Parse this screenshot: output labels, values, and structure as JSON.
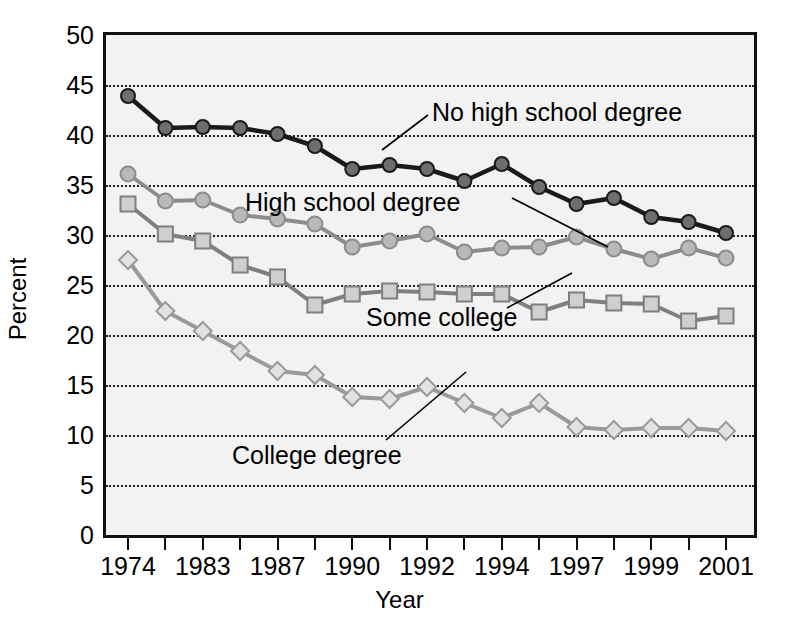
{
  "chart_data": {
    "type": "line",
    "title": "",
    "xlabel": "Year",
    "ylabel": "Percent",
    "ylim": [
      0,
      50
    ],
    "y_ticks": [
      0,
      5,
      10,
      15,
      20,
      25,
      30,
      35,
      40,
      45,
      50
    ],
    "grid": "horizontal-dotted",
    "legend_position": "inline-annotations",
    "x": [
      1974,
      1979,
      1983,
      1985,
      1987,
      1989,
      1990,
      1991,
      1992,
      1993,
      1994,
      1996,
      1997,
      1998,
      1999,
      2000,
      2001
    ],
    "x_tick_labels": [
      "1974",
      "1983",
      "1987",
      "1990",
      "1992",
      "1994",
      "1997",
      "1999",
      "2001"
    ],
    "x_tick_label_indices": [
      0,
      2,
      4,
      6,
      8,
      10,
      12,
      14,
      16
    ],
    "series": [
      {
        "name": "No high school degree",
        "marker": "circle",
        "color": "#1a1a1a",
        "marker_fill": "#6e6e6e",
        "values": [
          43.9,
          40.7,
          40.8,
          40.7,
          40.1,
          38.9,
          36.6,
          37.0,
          36.6,
          35.4,
          37.1,
          34.8,
          33.1,
          33.7,
          31.8,
          31.3,
          30.2
        ]
      },
      {
        "name": "High school degree",
        "marker": "circle",
        "color": "#8c8c8c",
        "marker_fill": "#b9b9b9",
        "values": [
          36.1,
          33.4,
          33.5,
          32.0,
          31.6,
          31.1,
          28.8,
          29.4,
          30.1,
          28.3,
          28.7,
          28.8,
          29.8,
          28.6,
          27.6,
          28.7,
          27.7
        ]
      },
      {
        "name": "Some college",
        "marker": "square",
        "color": "#7f7f7f",
        "marker_fill": "#cfcfcf",
        "values": [
          33.1,
          30.1,
          29.4,
          27.0,
          25.8,
          23.0,
          24.1,
          24.4,
          24.3,
          24.1,
          24.1,
          22.3,
          23.5,
          23.2,
          23.1,
          21.4,
          21.9
        ]
      },
      {
        "name": "College degree",
        "marker": "diamond",
        "color": "#9a9a9a",
        "marker_fill": "#e2e2e2",
        "values": [
          27.5,
          22.4,
          20.4,
          18.4,
          16.4,
          16.0,
          13.8,
          13.6,
          14.8,
          13.2,
          11.7,
          13.2,
          10.8,
          10.5,
          10.7,
          10.7,
          10.4
        ]
      }
    ],
    "annotations": [
      {
        "text": "No high school degree",
        "x": 432,
        "y": 100
      },
      {
        "text": "High school degree",
        "x": 245,
        "y": 190
      },
      {
        "text": "Some college",
        "x": 366,
        "y": 305
      },
      {
        "text": "College degree",
        "x": 232,
        "y": 443
      }
    ]
  },
  "axes": {
    "y_title": "Percent",
    "x_title": "Year"
  },
  "colors": {
    "plot_background": "#f2f2f2",
    "frame": "#111111",
    "gridline": "#222222",
    "no_hs": "#1a1a1a",
    "hs": "#8c8c8c",
    "some_college": "#7f7f7f",
    "college": "#9a9a9a"
  }
}
